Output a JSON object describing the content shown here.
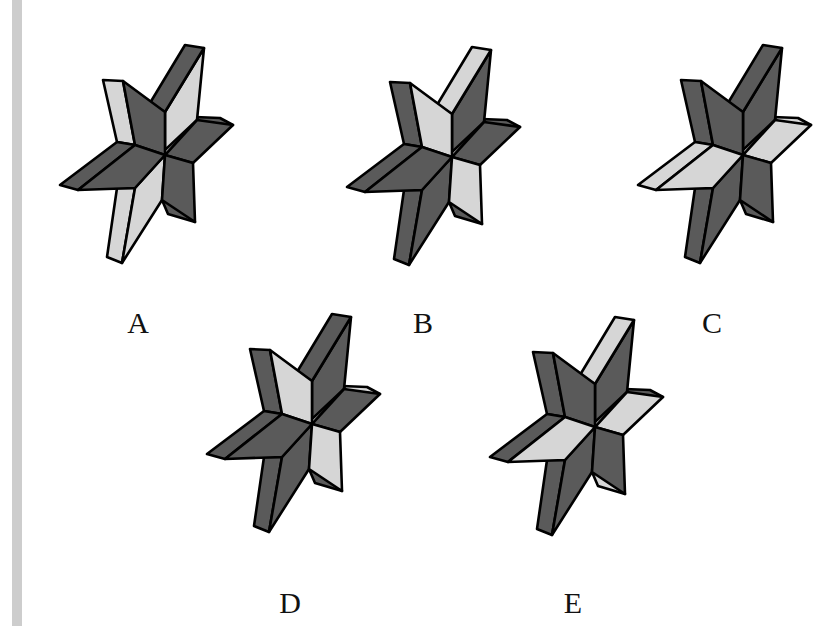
{
  "colors": {
    "dark": "#5a5a5a",
    "light": "#d6d6d6",
    "outline": "#000000",
    "strip": "#cdcdcd"
  },
  "options": [
    {
      "label": "A",
      "offset": [
        0,
        0
      ],
      "label_pos": [
        138,
        323
      ],
      "faces": {
        "top_front": "dark",
        "top_side": "light",
        "ul_side": "light",
        "ul_front": "dark",
        "left_top": "dark",
        "left_front": "dark",
        "right_back": "dark",
        "right_front": "dark",
        "lr_front": "dark",
        "lr_back": "dark",
        "bottom_front": "light",
        "bottom_side": "light"
      }
    },
    {
      "label": "B",
      "offset": [
        287,
        2
      ],
      "label_pos": [
        423,
        323
      ],
      "faces": {
        "top_front": "light",
        "top_side": "dark",
        "ul_side": "dark",
        "ul_front": "light",
        "left_top": "dark",
        "left_front": "dark",
        "right_back": "dark",
        "right_front": "dark",
        "lr_front": "light",
        "lr_back": "dark",
        "bottom_front": "dark",
        "bottom_side": "dark"
      }
    },
    {
      "label": "C",
      "offset": [
        578,
        0
      ],
      "label_pos": [
        712,
        323
      ],
      "faces": {
        "top_front": "dark",
        "top_side": "dark",
        "ul_side": "dark",
        "ul_front": "dark",
        "left_top": "light",
        "left_front": "light",
        "right_back": "light",
        "right_front": "light",
        "lr_front": "dark",
        "lr_back": "dark",
        "bottom_front": "dark",
        "bottom_side": "dark"
      }
    },
    {
      "label": "D",
      "offset": [
        147,
        269
      ],
      "label_pos": [
        290,
        603
      ],
      "faces": {
        "top_front": "dark",
        "top_side": "dark",
        "ul_side": "dark",
        "ul_front": "light",
        "left_top": "dark",
        "left_front": "dark",
        "right_back": "light",
        "right_front": "dark",
        "lr_front": "light",
        "lr_back": "dark",
        "bottom_front": "dark",
        "bottom_side": "dark"
      }
    },
    {
      "label": "E",
      "offset": [
        430,
        272
      ],
      "label_pos": [
        573,
        603
      ],
      "faces": {
        "top_front": "light",
        "top_side": "dark",
        "ul_side": "dark",
        "ul_front": "dark",
        "left_top": "dark",
        "left_front": "light",
        "right_back": "dark",
        "right_front": "light",
        "lr_front": "dark",
        "lr_back": "light",
        "bottom_front": "dark",
        "bottom_side": "dark"
      }
    }
  ]
}
